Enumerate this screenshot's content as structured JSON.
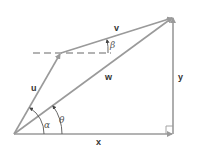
{
  "diagram": {
    "type": "vector-addition",
    "colors": {
      "line": "#9a9a9a",
      "label": "#333333",
      "background": "#ffffff"
    },
    "points": {
      "origin": [
        14,
        134
      ],
      "u_tip": [
        61,
        53
      ],
      "w_tip": [
        173,
        17
      ],
      "corner": [
        173,
        134
      ]
    },
    "vectors": [
      {
        "id": "u",
        "label": "u",
        "from": "origin",
        "to": "u_tip"
      },
      {
        "id": "v",
        "label": "v",
        "from": "u_tip",
        "to": "w_tip"
      },
      {
        "id": "w",
        "label": "w",
        "from": "origin",
        "to": "w_tip"
      },
      {
        "id": "x",
        "label": "x",
        "from": "origin",
        "to": "corner"
      },
      {
        "id": "y",
        "label": "y",
        "from": "corner",
        "to": "w_tip"
      }
    ],
    "labels": {
      "u": "u",
      "v": "v",
      "w": "w",
      "x": "x",
      "y": "y",
      "alpha": "α",
      "theta": "θ",
      "beta": "β"
    },
    "angles": [
      {
        "name": "alpha",
        "symbol": "α",
        "between": [
          "x",
          "u"
        ]
      },
      {
        "name": "theta",
        "symbol": "θ",
        "between": [
          "x",
          "w"
        ]
      },
      {
        "name": "beta",
        "symbol": "β",
        "between": [
          "horizontal-dashed",
          "v"
        ]
      }
    ],
    "right_angle_marker": "corner"
  }
}
